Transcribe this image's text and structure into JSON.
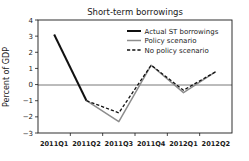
{
  "chart_data": {
    "type": "line",
    "title": "Short-term borrowings",
    "xlabel": "",
    "ylabel": "Percent of GDP",
    "categories": [
      "2011Q1",
      "2011Q2",
      "2011Q3",
      "2011Q4",
      "2012Q1",
      "2012Q2"
    ],
    "ylim": [
      -3,
      4
    ],
    "yticks": [
      4,
      3,
      2,
      1,
      0,
      -1,
      -2,
      -3
    ],
    "ytick_labels": [
      "4",
      "3",
      "2",
      "1",
      "0",
      "−1",
      "−2",
      "−3"
    ],
    "grid": false,
    "zero_line": true,
    "legend_position": "top-right",
    "series": [
      {
        "name": "Actual ST borrowings",
        "style": "solid",
        "color": "#111111",
        "width": 2.0,
        "values": [
          3.1,
          -1.0,
          null,
          null,
          null,
          null
        ]
      },
      {
        "name": "Policy scenario",
        "style": "solid",
        "color": "#8d8d8d",
        "width": 1.5,
        "values": [
          null,
          -1.0,
          -2.3,
          1.2,
          -0.5,
          0.8
        ]
      },
      {
        "name": "No policy scenario",
        "style": "dashed",
        "color": "#111111",
        "width": 1.3,
        "values": [
          null,
          -1.0,
          -1.75,
          1.2,
          -0.35,
          0.8
        ]
      }
    ]
  },
  "legend": {
    "items": [
      {
        "label": "Actual ST borrowings"
      },
      {
        "label": "Policy scenario"
      },
      {
        "label": "No policy scenario"
      }
    ]
  }
}
